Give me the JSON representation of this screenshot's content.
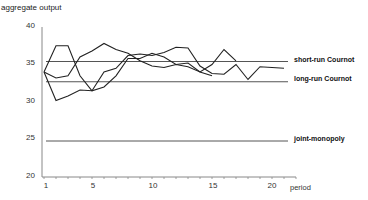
{
  "chart_data": {
    "type": "line",
    "title": "",
    "ylabel": "aggregate output",
    "xlabel": "period",
    "ylim": [
      20,
      40
    ],
    "xlim": [
      1,
      22
    ],
    "yticks": [
      20,
      25,
      30,
      35,
      40
    ],
    "xticks": [
      1,
      5,
      10,
      15,
      20
    ],
    "grid": false,
    "legend": "none",
    "x": [
      1,
      2,
      3,
      4,
      5,
      6,
      7,
      8,
      9,
      10,
      11,
      12,
      13,
      14,
      15,
      16,
      17,
      18,
      19,
      20,
      21
    ],
    "series": [
      {
        "name": "market 1",
        "values": [
          34.0,
          37.5,
          37.5,
          33.5,
          31.5,
          32.0,
          33.5,
          35.8,
          35.8,
          36.5,
          36.0,
          35.0,
          35.2,
          34.0,
          33.5,
          null,
          null,
          null,
          null,
          null,
          null
        ]
      },
      {
        "name": "market 2",
        "values": [
          34.0,
          33.2,
          33.5,
          36.0,
          36.8,
          37.8,
          37.0,
          36.5,
          35.5,
          34.8,
          34.6,
          35.0,
          34.7,
          34.0,
          35.0,
          37.0,
          35.5,
          null,
          null,
          null,
          null
        ]
      },
      {
        "name": "market 3",
        "values": [
          34.0,
          30.2,
          30.8,
          31.6,
          31.5,
          34.0,
          34.5,
          36.2,
          36.4,
          36.2,
          36.6,
          37.3,
          37.2,
          34.8,
          33.8,
          33.7,
          35.0,
          33.0,
          34.7,
          34.6,
          34.5
        ]
      }
    ],
    "reference_lines": [
      {
        "name": "short-run Cournot",
        "value": 35.4
      },
      {
        "name": "long-run Cournot",
        "value": 32.7
      },
      {
        "name": "joint-monopoly",
        "value": 24.8
      }
    ]
  },
  "labels": {
    "y_title": "aggregate output",
    "x_title": "period",
    "yticks": [
      "40",
      "35",
      "30",
      "25",
      "20"
    ],
    "xticks": [
      "1",
      "5",
      "10",
      "15",
      "20"
    ],
    "ref_short": "short-run Cournot",
    "ref_long": "long-run Cournot",
    "ref_joint": "joint-monopoly"
  }
}
